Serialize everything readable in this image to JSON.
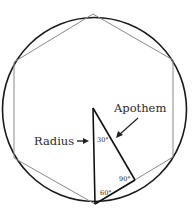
{
  "diagram": {
    "type": "regular hexagon inscribed in circle",
    "colors": {
      "circle_stroke": "#1a1a1a",
      "hexagon_stroke": "#8a8a8a",
      "triangle_stroke": "#111111",
      "text": "#2a2a2a"
    },
    "labels": {
      "radius": "Radius",
      "radius_arrow": "→",
      "apothem": "Apothem"
    },
    "angles": {
      "top": "30°",
      "right": "90°",
      "bottom": "60°"
    }
  }
}
